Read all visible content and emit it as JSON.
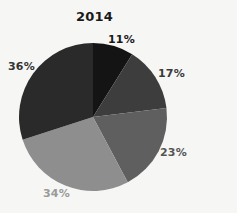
{
  "chart_data": {
    "type": "pie",
    "title": "2014",
    "categories": [
      "Slice 1",
      "Slice 2",
      "Slice 3",
      "Slice 4",
      "Slice 5"
    ],
    "values": [
      11,
      17,
      23,
      34,
      36
    ],
    "labels": [
      "11%",
      "17%",
      "23%",
      "34%",
      "36%"
    ],
    "colors": [
      "#141414",
      "#3d3d3d",
      "#5f5f5f",
      "#8e8e8e",
      "#2a2a2a"
    ],
    "label_colors": [
      "#1a1a1a",
      "#3a3a3a",
      "#555555",
      "#9a9a9a",
      "#333333"
    ],
    "start_angle_deg": 0,
    "direction": "clockwise",
    "visual_boundaries_deg": [
      0,
      32,
      83,
      152,
      252,
      360
    ],
    "legend": "none",
    "grid": false
  },
  "layout": {
    "center": [
      93,
      117
    ],
    "radius": 74,
    "label_positions": [
      {
        "x": 108,
        "y": 33
      },
      {
        "x": 158,
        "y": 67
      },
      {
        "x": 160,
        "y": 146
      },
      {
        "x": 43,
        "y": 187
      },
      {
        "x": 8,
        "y": 60
      }
    ]
  }
}
